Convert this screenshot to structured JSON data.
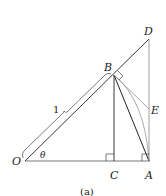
{
  "diagram": {
    "points": {
      "O": {
        "label": "O"
      },
      "A": {
        "label": "A"
      },
      "B": {
        "label": "B"
      },
      "C": {
        "label": "C"
      },
      "D": {
        "label": "D"
      },
      "E": {
        "label": "E"
      }
    },
    "angle_label": "θ",
    "length_label": "1",
    "caption": "(a)",
    "colors": {
      "line": "#222222",
      "arc": "#888888"
    }
  }
}
